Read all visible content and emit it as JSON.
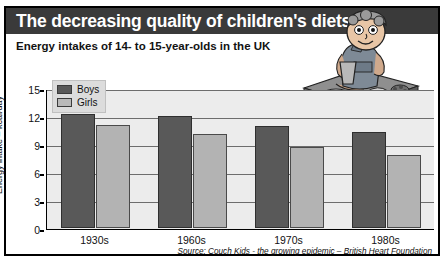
{
  "header": {
    "title": "The decreasing quality of children's diets",
    "subtitle": "Energy intakes of 14- to 15-year-olds in the UK"
  },
  "illustration": {
    "name": "child-eating-junk-food-illustration"
  },
  "colors": {
    "title_bar": "#3a3a3a",
    "boys": "#595959",
    "girls": "#b3b3b3",
    "plot_background": "#ececec",
    "gridline": "#6d6d6d"
  },
  "chart_data": {
    "type": "bar",
    "title": "Energy intakes of 14- to 15-year-olds in the UK",
    "xlabel": "",
    "ylabel": "Energy intake – kcal/day",
    "categories": [
      "1930s",
      "1960s",
      "1970s",
      "1980s"
    ],
    "series": [
      {
        "name": "Boys",
        "values": [
          12.2,
          11.9,
          10.9,
          10.2
        ]
      },
      {
        "name": "Girls",
        "values": [
          11.0,
          10.0,
          8.6,
          7.8
        ]
      }
    ],
    "ylim": [
      0,
      15
    ],
    "yticks": [
      0,
      3,
      6,
      9,
      12,
      15
    ],
    "ytick_labels": [
      "0",
      "3",
      "6",
      "9",
      "12",
      "15"
    ],
    "grid": true,
    "legend": [
      "Boys",
      "Girls"
    ],
    "legend_position": "top-left",
    "source": "Source: Couch Kids - the growing epidemic – British Heart Foundation"
  }
}
